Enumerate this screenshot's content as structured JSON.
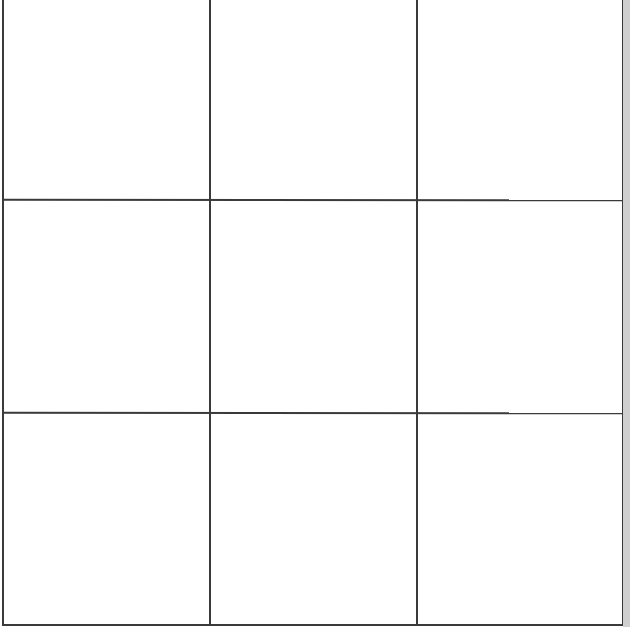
{
  "game": {
    "type": "tic-tac-toe",
    "rows": 3,
    "cols": 3,
    "cells": [
      {
        "row": 0,
        "col": 0,
        "mark": ""
      },
      {
        "row": 0,
        "col": 1,
        "mark": ""
      },
      {
        "row": 0,
        "col": 2,
        "mark": ""
      },
      {
        "row": 1,
        "col": 0,
        "mark": ""
      },
      {
        "row": 1,
        "col": 1,
        "mark": ""
      },
      {
        "row": 1,
        "col": 2,
        "mark": ""
      },
      {
        "row": 2,
        "col": 0,
        "mark": ""
      },
      {
        "row": 2,
        "col": 1,
        "mark": ""
      },
      {
        "row": 2,
        "col": 2,
        "mark": ""
      }
    ]
  },
  "colors": {
    "background": "#ffffff",
    "grid_line": "#3a3a3a",
    "edge_strip": "#cfcfcf"
  }
}
